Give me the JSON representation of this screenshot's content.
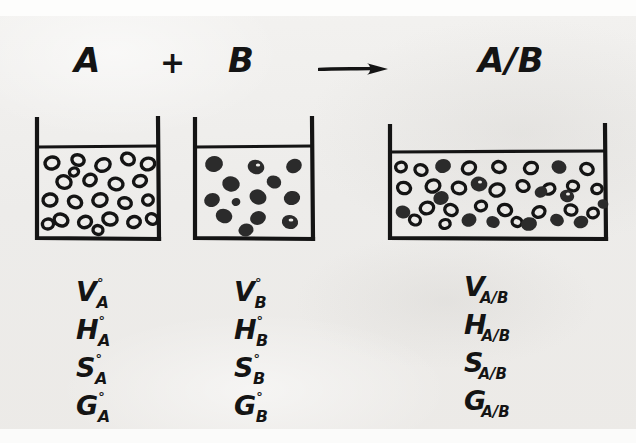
{
  "figure": {
    "kind": "hand-drawn thermodynamics diagram",
    "background_color": "#efeeeb",
    "ink_color": "#141414"
  },
  "equation": {
    "reactant_a": "A",
    "plus": "+",
    "reactant_b": "B",
    "arrow": "arrow-right-icon",
    "product": "A/B"
  },
  "beakers": [
    {
      "id": "beaker-a",
      "label": "A",
      "particle_style": "hollow",
      "particle_count": 22,
      "wall_x": 36,
      "wall_right": 157,
      "top_y": 119,
      "bottom_y": 239,
      "liquid_y": 147
    },
    {
      "id": "beaker-b",
      "label": "B",
      "particle_style": "filled",
      "particle_count": 13,
      "wall_x": 194,
      "wall_right": 311,
      "top_y": 119,
      "bottom_y": 239,
      "liquid_y": 147
    },
    {
      "id": "beaker-ab",
      "label": "A/B",
      "particle_style": "mixed",
      "particle_count": 45,
      "wall_x": 389,
      "wall_right": 606,
      "top_y": 127,
      "bottom_y": 239,
      "liquid_y": 152
    }
  ],
  "properties": {
    "column_a": {
      "heading": "A",
      "rows": [
        {
          "symbol": "V",
          "superscript": "°",
          "subscript": "A"
        },
        {
          "symbol": "H",
          "superscript": "°",
          "subscript": "A"
        },
        {
          "symbol": "S",
          "superscript": "°",
          "subscript": "A"
        },
        {
          "symbol": "G",
          "superscript": "°",
          "subscript": "A"
        }
      ]
    },
    "column_b": {
      "heading": "B",
      "rows": [
        {
          "symbol": "V",
          "superscript": "°",
          "subscript": "B"
        },
        {
          "symbol": "H",
          "superscript": "°",
          "subscript": "B"
        },
        {
          "symbol": "S",
          "superscript": "°",
          "subscript": "B"
        },
        {
          "symbol": "G",
          "superscript": "°",
          "subscript": "B"
        }
      ]
    },
    "column_ab": {
      "heading": "A/B",
      "rows": [
        {
          "symbol": "V",
          "superscript": "",
          "subscript": "A/B"
        },
        {
          "symbol": "H",
          "superscript": "",
          "subscript": "A/B"
        },
        {
          "symbol": "S",
          "superscript": "",
          "subscript": "A/B"
        },
        {
          "symbol": "G",
          "superscript": "",
          "subscript": "A/B"
        }
      ]
    }
  }
}
